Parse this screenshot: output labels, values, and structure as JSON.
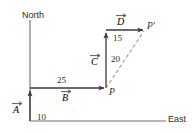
{
  "figure": {
    "axes": {
      "north_label": "North",
      "east_label": "East"
    },
    "vectors": [
      {
        "name": "A",
        "label": "A",
        "magnitude": "10",
        "direction": "north"
      },
      {
        "name": "B",
        "label": "B",
        "magnitude": "25",
        "direction": "east"
      },
      {
        "name": "C",
        "label": "C",
        "magnitude": "20",
        "direction": "north"
      },
      {
        "name": "D",
        "label": "D",
        "magnitude": "15",
        "direction": "east"
      }
    ],
    "points": [
      {
        "name": "P",
        "label": "P"
      },
      {
        "name": "P-prime",
        "label": "P'"
      }
    ],
    "colors": {
      "stroke": "#3a3a3a",
      "text": "#2b2b2b",
      "background": "#ffffff"
    }
  }
}
